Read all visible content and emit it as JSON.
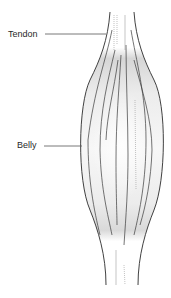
{
  "diagram": {
    "labels": [
      {
        "id": "tendon",
        "text": "Tendon"
      },
      {
        "id": "belly",
        "text": "Belly"
      }
    ],
    "colors": {
      "outline": "#2b2b2b",
      "fibers": "#3a3a3a",
      "shading": "#d8d8d8",
      "leader_line": "#555555",
      "background": "#ffffff"
    }
  }
}
